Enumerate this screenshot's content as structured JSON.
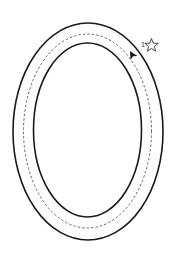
{
  "diagram": {
    "type": "oval-track",
    "start_marker": {
      "label": "1",
      "icon": "star-outline-icon"
    },
    "direction_arrow": {
      "icon": "arrowhead-icon",
      "direction": "counter-clockwise"
    },
    "colors": {
      "stroke": "#1a1a1a",
      "dashed": "#555555",
      "background": "#ffffff"
    }
  }
}
